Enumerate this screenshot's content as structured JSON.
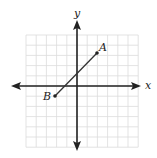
{
  "figure": {
    "type": "coordinate-plane",
    "axes": {
      "x_label": "x",
      "y_label": "y"
    },
    "grid": {
      "visible": true,
      "x_range": [
        -5,
        6
      ],
      "y_range": [
        -6,
        5
      ],
      "color": "#dcdcdc"
    },
    "segment": {
      "points": [
        {
          "label": "A",
          "x": 2,
          "y": 3
        },
        {
          "label": "B",
          "x": -2,
          "y": -1
        }
      ],
      "color": "#333333"
    },
    "colors": {
      "axis": "#222222",
      "background": "#ffffff"
    }
  }
}
